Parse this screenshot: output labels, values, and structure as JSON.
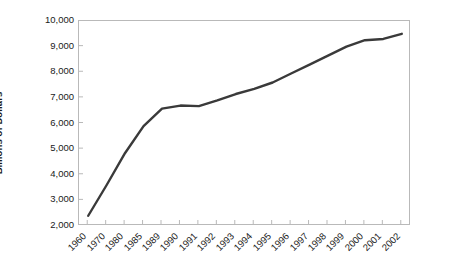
{
  "chart_data": {
    "type": "line",
    "title": "",
    "subtitle": "",
    "xlabel": "",
    "ylabel": "Billions of Dollars",
    "categories": [
      "1960",
      "1970",
      "1980",
      "1985",
      "1989",
      "1990",
      "1991",
      "1992",
      "1993",
      "1994",
      "1995",
      "1996",
      "1997",
      "1998",
      "1999",
      "2000",
      "2001",
      "2002"
    ],
    "values": [
      2400,
      3600,
      4850,
      5900,
      6580,
      6700,
      6680,
      6900,
      7150,
      7350,
      7600,
      7950,
      8300,
      8650,
      9000,
      9250,
      9300,
      9500
    ],
    "series": [
      {
        "name": "",
        "values": [
          2400,
          3600,
          4850,
          5900,
          6580,
          6700,
          6680,
          6900,
          7150,
          7350,
          7600,
          7950,
          8300,
          8650,
          9000,
          9250,
          9300,
          9500
        ],
        "color": "#3a3a3a"
      }
    ],
    "ylim": [
      2000,
      10000
    ],
    "ytick_step": 1000,
    "ytick_labels": [
      "10,000",
      "9,000",
      "8,000",
      "7,000",
      "6,000",
      "5,000",
      "4,000",
      "3,000",
      "2,000"
    ],
    "ytick_values": [
      10000,
      9000,
      8000,
      7000,
      6000,
      5000,
      4000,
      3000,
      2000
    ],
    "grid": false,
    "legend": false,
    "legend_position": "none",
    "line_color": "#3a3a3a",
    "line_width": 2.4,
    "axis_color": "#b9b9b9",
    "background_color": "#ffffff",
    "text_color": "#1a1a1a",
    "xtick_rotation": -45
  }
}
